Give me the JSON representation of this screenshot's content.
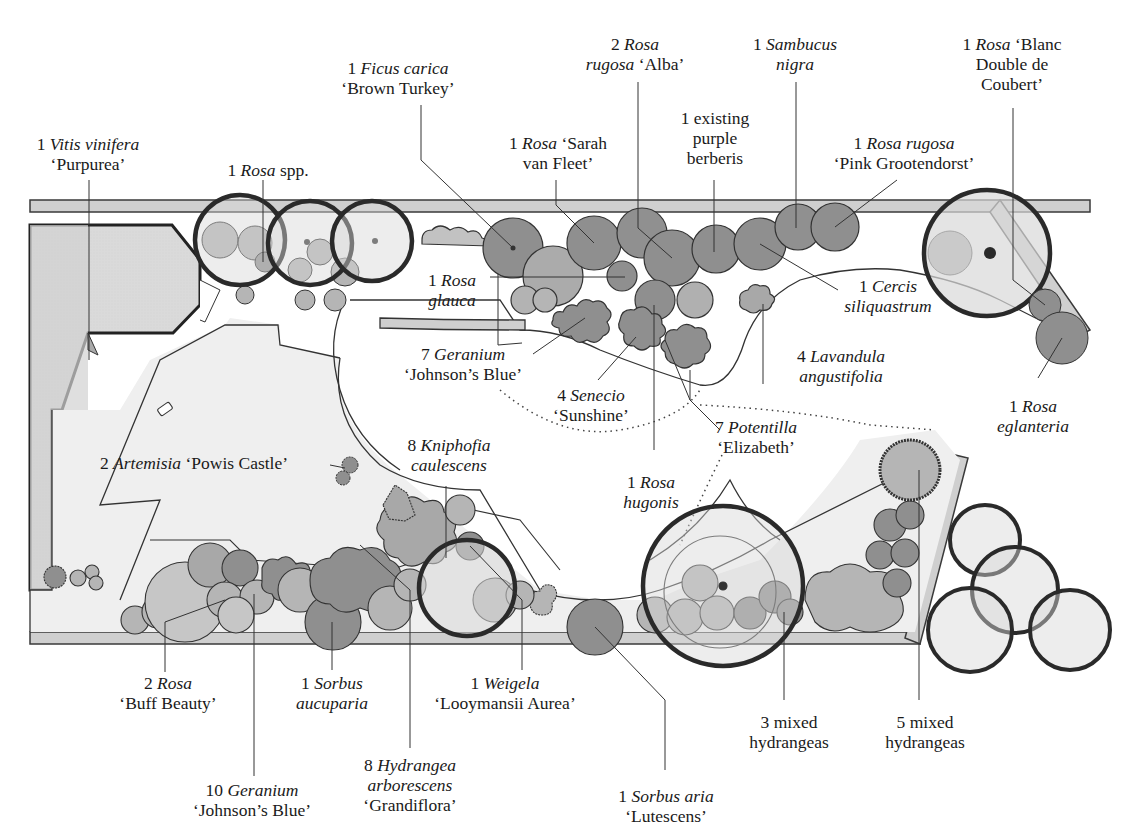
{
  "colors": {
    "wall_fill": "#cfcfcf",
    "paving_fill": "#f0f0f0",
    "plant_dark": "#8f8f8f",
    "plant_mid": "#a9a9a9",
    "plant_light": "#c6c6c6",
    "tree_canopy": "#d8d8d8",
    "outline": "#2a2a2a"
  },
  "labels": [
    {
      "id": "vitis",
      "lines": [
        [
          {
            "t": "1 "
          },
          {
            "t": "Vitis vinifera",
            "i": true
          }
        ],
        [
          {
            "t": "‘Purpurea’"
          }
        ]
      ],
      "x": 88,
      "y": 134
    },
    {
      "id": "rosa-spp",
      "lines": [
        [
          {
            "t": "1 "
          },
          {
            "t": "Rosa",
            "i": true
          },
          {
            "t": " spp."
          }
        ]
      ],
      "x": 268,
      "y": 160
    },
    {
      "id": "ficus",
      "lines": [
        [
          {
            "t": "1 "
          },
          {
            "t": "Ficus carica",
            "i": true
          }
        ],
        [
          {
            "t": "‘Brown Turkey’"
          }
        ]
      ],
      "x": 398,
      "y": 58
    },
    {
      "id": "rosa-sarah",
      "lines": [
        [
          {
            "t": "1 "
          },
          {
            "t": "Rosa",
            "i": true
          },
          {
            "t": " ‘Sarah"
          }
        ],
        [
          {
            "t": "van Fleet’"
          }
        ]
      ],
      "x": 558,
      "y": 133
    },
    {
      "id": "rosa-rugosa-alba",
      "lines": [
        [
          {
            "t": "2 "
          },
          {
            "t": "Rosa",
            "i": true
          }
        ],
        [
          {
            "t": "rugosa",
            "i": true
          },
          {
            "t": " ‘Alba’"
          }
        ]
      ],
      "x": 635,
      "y": 34
    },
    {
      "id": "berberis",
      "lines": [
        [
          {
            "t": "1 existing"
          }
        ],
        [
          {
            "t": "purple"
          }
        ],
        [
          {
            "t": "berberis"
          }
        ]
      ],
      "x": 715,
      "y": 108
    },
    {
      "id": "sambucus",
      "lines": [
        [
          {
            "t": "1 "
          },
          {
            "t": "Sambucus",
            "i": true
          }
        ],
        [
          {
            "t": "nigra",
            "i": true
          }
        ]
      ],
      "x": 795,
      "y": 34
    },
    {
      "id": "rosa-pink-groot",
      "lines": [
        [
          {
            "t": "1 "
          },
          {
            "t": "Rosa rugosa",
            "i": true
          }
        ],
        [
          {
            "t": "‘Pink Grootendorst’"
          }
        ]
      ],
      "x": 904,
      "y": 133
    },
    {
      "id": "rosa-blanc",
      "lines": [
        [
          {
            "t": "1 "
          },
          {
            "t": "Rosa",
            "i": true
          },
          {
            "t": " ‘Blanc"
          }
        ],
        [
          {
            "t": "Double de"
          }
        ],
        [
          {
            "t": "Coubert’"
          }
        ]
      ],
      "x": 1012,
      "y": 34
    },
    {
      "id": "rosa-glauca",
      "lines": [
        [
          {
            "t": "1 "
          },
          {
            "t": "Rosa",
            "i": true
          }
        ],
        [
          {
            "t": "glauca",
            "i": true
          }
        ]
      ],
      "x": 452,
      "y": 270
    },
    {
      "id": "cercis",
      "lines": [
        [
          {
            "t": "1 "
          },
          {
            "t": "Cercis",
            "i": true
          }
        ],
        [
          {
            "t": "siliquastrum",
            "i": true
          }
        ]
      ],
      "x": 888,
      "y": 276
    },
    {
      "id": "geranium-7",
      "lines": [
        [
          {
            "t": "7 "
          },
          {
            "t": "Geranium",
            "i": true
          }
        ],
        [
          {
            "t": "‘Johnson’s Blue’"
          }
        ]
      ],
      "x": 463,
      "y": 344
    },
    {
      "id": "lavandula",
      "lines": [
        [
          {
            "t": "4 "
          },
          {
            "t": "Lavandula",
            "i": true
          }
        ],
        [
          {
            "t": "angustifolia",
            "i": true
          }
        ]
      ],
      "x": 841,
      "y": 346
    },
    {
      "id": "senecio",
      "lines": [
        [
          {
            "t": "4 "
          },
          {
            "t": "Senecio",
            "i": true
          }
        ],
        [
          {
            "t": "‘Sunshine’"
          }
        ]
      ],
      "x": 591,
      "y": 385
    },
    {
      "id": "potentilla",
      "lines": [
        [
          {
            "t": "7 "
          },
          {
            "t": "Potentilla",
            "i": true
          }
        ],
        [
          {
            "t": "‘Elizabeth’"
          }
        ]
      ],
      "x": 756,
      "y": 417
    },
    {
      "id": "rosa-eglanteria",
      "lines": [
        [
          {
            "t": "1 "
          },
          {
            "t": "Rosa",
            "i": true
          }
        ],
        [
          {
            "t": "eglanteria",
            "i": true
          }
        ]
      ],
      "x": 1033,
      "y": 396
    },
    {
      "id": "artemisia",
      "lines": [
        [
          {
            "t": "2 "
          },
          {
            "t": "Artemisia",
            "i": true
          },
          {
            "t": " ‘Powis Castle’"
          }
        ]
      ],
      "x": 194,
      "y": 453
    },
    {
      "id": "kniphofia",
      "lines": [
        [
          {
            "t": "8 "
          },
          {
            "t": "Kniphofia",
            "i": true
          }
        ],
        [
          {
            "t": "caulescens",
            "i": true
          }
        ]
      ],
      "x": 449,
      "y": 435
    },
    {
      "id": "rosa-hugonis",
      "lines": [
        [
          {
            "t": "1 "
          },
          {
            "t": "Rosa",
            "i": true
          }
        ],
        [
          {
            "t": "hugonis",
            "i": true
          }
        ]
      ],
      "x": 651,
      "y": 472
    },
    {
      "id": "rosa-buff",
      "lines": [
        [
          {
            "t": "2 "
          },
          {
            "t": "Rosa",
            "i": true
          }
        ],
        [
          {
            "t": "‘Buff Beauty’"
          }
        ]
      ],
      "x": 168,
      "y": 673
    },
    {
      "id": "sorbus-aucuparia",
      "lines": [
        [
          {
            "t": "1 "
          },
          {
            "t": "Sorbus",
            "i": true
          }
        ],
        [
          {
            "t": "aucuparia",
            "i": true
          }
        ]
      ],
      "x": 332,
      "y": 673
    },
    {
      "id": "weigela",
      "lines": [
        [
          {
            "t": "1 "
          },
          {
            "t": "Weigela",
            "i": true
          }
        ],
        [
          {
            "t": "‘Looymansii Aurea’"
          }
        ]
      ],
      "x": 505,
      "y": 673
    },
    {
      "id": "geranium-10",
      "lines": [
        [
          {
            "t": "10 "
          },
          {
            "t": "Geranium",
            "i": true
          }
        ],
        [
          {
            "t": "‘Johnson’s Blue’"
          }
        ]
      ],
      "x": 252,
      "y": 780
    },
    {
      "id": "hydrangea-arb",
      "lines": [
        [
          {
            "t": "8 "
          },
          {
            "t": "Hydrangea",
            "i": true
          }
        ],
        [
          {
            "t": "arborescens",
            "i": true
          }
        ],
        [
          {
            "t": "‘Grandiflora’"
          }
        ]
      ],
      "x": 410,
      "y": 755
    },
    {
      "id": "sorbus-aria",
      "lines": [
        [
          {
            "t": "1 "
          },
          {
            "t": "Sorbus aria",
            "i": true
          }
        ],
        [
          {
            "t": "‘Lutescens’"
          }
        ]
      ],
      "x": 666,
      "y": 786
    },
    {
      "id": "hydrangeas-3",
      "lines": [
        [
          {
            "t": "3 mixed"
          }
        ],
        [
          {
            "t": "hydrangeas"
          }
        ]
      ],
      "x": 789,
      "y": 712
    },
    {
      "id": "hydrangeas-5",
      "lines": [
        [
          {
            "t": "5 mixed"
          }
        ],
        [
          {
            "t": "hydrangeas"
          }
        ]
      ],
      "x": 925,
      "y": 712
    }
  ],
  "plant_counts": {
    "vitis_vinifera_purpurea": 1,
    "rosa_spp": 1,
    "ficus_carica_brown_turkey": 1,
    "rosa_sarah_van_fleet": 1,
    "rosa_rugosa_alba": 2,
    "existing_purple_berberis": 1,
    "sambucus_nigra": 1,
    "rosa_rugosa_pink_grootendorst": 1,
    "rosa_blanc_double_de_coubert": 1,
    "rosa_glauca": 1,
    "cercis_siliquastrum": 1,
    "geranium_johnsons_blue_north": 7,
    "lavandula_angustifolia": 4,
    "senecio_sunshine": 4,
    "potentilla_elizabeth": 7,
    "rosa_eglanteria": 1,
    "artemisia_powis_castle": 2,
    "kniphofia_caulescens": 8,
    "rosa_hugonis": 1,
    "rosa_buff_beauty": 2,
    "sorbus_aucuparia": 1,
    "weigela_looymansii_aurea": 1,
    "geranium_johnsons_blue_south": 10,
    "hydrangea_arborescens_grandiflora": 8,
    "sorbus_aria_lutescens": 1,
    "mixed_hydrangeas_3": 3,
    "mixed_hydrangeas_5": 5
  }
}
